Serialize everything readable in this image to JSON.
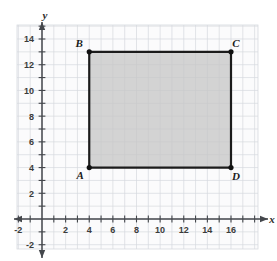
{
  "page": {
    "cut_off_header_text": "",
    "background_color": "#ffffff"
  },
  "chart_data": {
    "type": "scatter",
    "title": "",
    "subtitle": "",
    "xlabel": "x",
    "ylabel": "y",
    "xlim": [
      -2.6,
      18.2
    ],
    "ylim": [
      -2.6,
      15.6
    ],
    "grid": true,
    "grid_step": 1,
    "grid_color": "#d6d9de",
    "axis_color": "#44474c",
    "legend": "none",
    "x_tick_labels": [
      "-2",
      "2",
      "4",
      "6",
      "8",
      "10",
      "12",
      "14",
      "16"
    ],
    "x_tick_values": [
      -2,
      2,
      4,
      6,
      8,
      10,
      12,
      14,
      16
    ],
    "y_tick_labels": [
      "14",
      "12",
      "10",
      "8",
      "6",
      "4",
      "2",
      "-2"
    ],
    "y_tick_values": [
      14,
      12,
      10,
      8,
      6,
      4,
      2,
      -2
    ],
    "minor_tick_step": 1,
    "shapes": [
      {
        "name": "rectangle-ABCD",
        "kind": "polygon",
        "fill": "#c5c5c5",
        "fill_opacity": 0.75,
        "stroke": "#1b1b1b",
        "stroke_width": 2.2,
        "vertices": [
          {
            "label": "A",
            "x": 4,
            "y": 4,
            "label_dx": -9,
            "label_dy": 11
          },
          {
            "label": "B",
            "x": 4,
            "y": 13,
            "label_dx": -10,
            "label_dy": -5
          },
          {
            "label": "C",
            "x": 16,
            "y": 13,
            "label_dx": 5,
            "label_dy": -5
          },
          {
            "label": "D",
            "x": 16,
            "y": 4,
            "label_dx": 5,
            "label_dy": 12
          }
        ],
        "width_units": 12,
        "height_units": 9
      }
    ],
    "points": [
      {
        "label": "A",
        "x": 4,
        "y": 4
      },
      {
        "label": "B",
        "x": 4,
        "y": 13
      },
      {
        "label": "C",
        "x": 16,
        "y": 13
      },
      {
        "label": "D",
        "x": 16,
        "y": 4
      }
    ],
    "point_color": "#111111",
    "point_radius": 2.6
  }
}
